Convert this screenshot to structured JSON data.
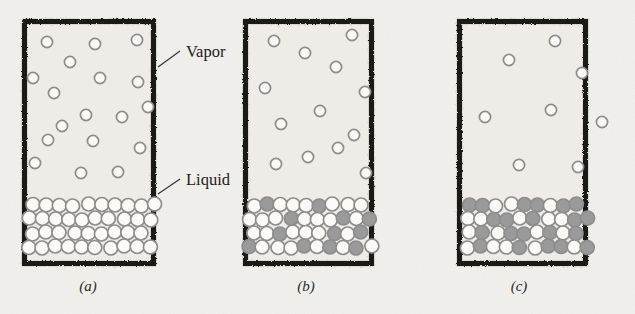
{
  "figure": {
    "background_color": "#f2f0ec",
    "paper_tint": "#efece7",
    "wall_color": "#1d1b19",
    "molecule_outline_color": "#8d8d8d",
    "molecule_open_fill": "#fbfaf7",
    "molecule_filled_fill": "#9a9a9a",
    "leader_line_color": "#3a3836"
  },
  "annotations": [
    {
      "id": "vapor",
      "label": "Vapor",
      "text_x": 186,
      "text_y": 57,
      "leader": {
        "x1": 158,
        "y1": 67,
        "x2": 180,
        "y2": 51
      }
    },
    {
      "id": "liquid",
      "label": "Liquid",
      "text_x": 186,
      "text_y": 185,
      "leader": {
        "x1": 158,
        "y1": 194,
        "x2": 180,
        "y2": 179
      }
    }
  ],
  "panels": [
    {
      "id": "panel-a",
      "caption": "(a)",
      "caption_x": 88,
      "caption_y": 291,
      "box": {
        "x": 22,
        "y": 19,
        "width": 134,
        "height": 247
      },
      "liquid_level_y": 196,
      "vapor_molecule_count": 18,
      "liquid_open_count": 37,
      "liquid_filled_count": 0,
      "filled_fraction_percent": 0,
      "vapor_molecules": [
        {
          "cx": 47,
          "cy": 42
        },
        {
          "cx": 95,
          "cy": 44
        },
        {
          "cx": 137,
          "cy": 40
        },
        {
          "cx": 70,
          "cy": 62
        },
        {
          "cx": 33,
          "cy": 78
        },
        {
          "cx": 100,
          "cy": 78
        },
        {
          "cx": 138,
          "cy": 82
        },
        {
          "cx": 54,
          "cy": 93
        },
        {
          "cx": 86,
          "cy": 115
        },
        {
          "cx": 122,
          "cy": 117
        },
        {
          "cx": 48,
          "cy": 140
        },
        {
          "cx": 93,
          "cy": 141
        },
        {
          "cx": 140,
          "cy": 148
        },
        {
          "cx": 35,
          "cy": 163
        },
        {
          "cx": 81,
          "cy": 173
        },
        {
          "cx": 118,
          "cy": 172
        },
        {
          "cx": 62,
          "cy": 126
        },
        {
          "cx": 148,
          "cy": 107
        }
      ],
      "liquid_rows": [
        {
          "y": 205,
          "x_start": 33,
          "spacing": 13.6,
          "count": 10,
          "filled_indices": []
        },
        {
          "y": 219,
          "x_start": 28,
          "spacing": 13.6,
          "count": 10,
          "filled_indices": []
        },
        {
          "y": 233,
          "x_start": 33,
          "spacing": 13.6,
          "count": 9,
          "filled_indices": []
        },
        {
          "y": 247,
          "x_start": 28,
          "spacing": 13.6,
          "count": 10,
          "filled_indices": []
        }
      ]
    },
    {
      "id": "panel-b",
      "caption": "(b)",
      "caption_x": 306,
      "caption_y": 291,
      "box": {
        "x": 243,
        "y": 19,
        "width": 131,
        "height": 247
      },
      "liquid_level_y": 196,
      "vapor_molecule_count": 13,
      "liquid_open_count": 27,
      "liquid_filled_count": 12,
      "filled_fraction_percent": 31,
      "vapor_molecules": [
        {
          "cx": 274,
          "cy": 41
        },
        {
          "cx": 352,
          "cy": 35
        },
        {
          "cx": 305,
          "cy": 53
        },
        {
          "cx": 336,
          "cy": 67
        },
        {
          "cx": 265,
          "cy": 88
        },
        {
          "cx": 365,
          "cy": 92
        },
        {
          "cx": 320,
          "cy": 111
        },
        {
          "cx": 281,
          "cy": 124
        },
        {
          "cx": 354,
          "cy": 135
        },
        {
          "cx": 308,
          "cy": 157
        },
        {
          "cx": 276,
          "cy": 164
        },
        {
          "cx": 366,
          "cy": 173
        },
        {
          "cx": 338,
          "cy": 148
        }
      ],
      "liquid_rows": [
        {
          "y": 205,
          "x_start": 253,
          "spacing": 13.4,
          "count": 9,
          "filled_indices": [
            1,
            5
          ]
        },
        {
          "y": 219,
          "x_start": 250,
          "spacing": 13.4,
          "count": 10,
          "filled_indices": [
            3,
            7,
            9
          ]
        },
        {
          "y": 233,
          "x_start": 253,
          "spacing": 13.4,
          "count": 9,
          "filled_indices": [
            2,
            6,
            8
          ]
        },
        {
          "y": 247,
          "x_start": 250,
          "spacing": 13.4,
          "count": 10,
          "filled_indices": [
            0,
            4,
            6,
            8
          ]
        }
      ]
    },
    {
      "id": "panel-c",
      "caption": "(c)",
      "caption_x": 519,
      "caption_y": 291,
      "box": {
        "x": 457,
        "y": 19,
        "width": 131,
        "height": 247
      },
      "liquid_level_y": 196,
      "vapor_molecule_count": 8,
      "liquid_open_count": 19,
      "liquid_filled_count": 21,
      "filled_fraction_percent": 53,
      "vapor_molecules": [
        {
          "cx": 555,
          "cy": 41
        },
        {
          "cx": 509,
          "cy": 60
        },
        {
          "cx": 582,
          "cy": 73
        },
        {
          "cx": 485,
          "cy": 117
        },
        {
          "cx": 551,
          "cy": 110
        },
        {
          "cx": 602,
          "cy": 122
        },
        {
          "cx": 519,
          "cy": 165
        },
        {
          "cx": 578,
          "cy": 167
        }
      ],
      "liquid_rows": [
        {
          "y": 205,
          "x_start": 470,
          "spacing": 13.4,
          "count": 9,
          "filled_indices": [
            0,
            1,
            4,
            5,
            7,
            8
          ]
        },
        {
          "y": 219,
          "x_start": 467,
          "spacing": 13.4,
          "count": 10,
          "filled_indices": [
            2,
            3,
            5,
            8,
            9
          ]
        },
        {
          "y": 233,
          "x_start": 470,
          "spacing": 13.4,
          "count": 9,
          "filled_indices": [
            1,
            3,
            4,
            6,
            8
          ]
        },
        {
          "y": 247,
          "x_start": 467,
          "spacing": 13.4,
          "count": 10,
          "filled_indices": [
            1,
            4,
            6,
            7,
            9
          ]
        }
      ]
    }
  ]
}
